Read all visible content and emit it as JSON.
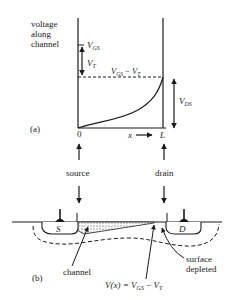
{
  "figure": {
    "part_a": {
      "tag": "(a)",
      "y_axis_label": [
        "voltage",
        "along",
        "channel"
      ],
      "levels": {
        "vgs": {
          "main": "V",
          "sub": "GS"
        },
        "vt": {
          "main": "V",
          "sub": "T"
        },
        "vgs_minus_vt": {
          "main1": "V",
          "sub1": "GS",
          "op": " − ",
          "main2": "V",
          "sub2": "T"
        },
        "vds": {
          "main": "V",
          "sub": "DS"
        }
      },
      "x_axis": {
        "origin": "0",
        "var": "x",
        "end": "L"
      },
      "curve_description": "channel voltage rises from 0 at source to VGS − VT at drain (pinch-off)"
    },
    "terminals": {
      "source": "source",
      "drain": "drain"
    },
    "part_b": {
      "tag": "(b)",
      "source_label": "S",
      "drain_label": "D",
      "callouts": {
        "channel": "channel",
        "surface_depleted": [
          "surface",
          "depleted"
        ],
        "pinch_condition": {
          "pre": "V(x) = ",
          "m1": "V",
          "s1": "GS",
          "op": " − ",
          "m2": "V",
          "s2": "T"
        }
      }
    }
  }
}
